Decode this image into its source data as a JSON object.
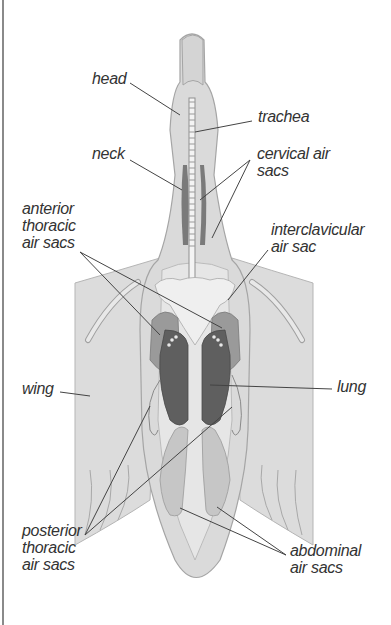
{
  "diagram": {
    "colors": {
      "body": "#d9d9d9",
      "outline": "#9a9a9a",
      "wing": "#dcdcdc",
      "air_sac": "#c8c8c8",
      "lung": "#6e6e6e",
      "lung_dark": "#555555",
      "leader_line": "#444444",
      "text": "#333333"
    },
    "labels": {
      "head": "head",
      "trachea": "trachea",
      "neck": "neck",
      "cervical_air_sacs": "cervical air\nsacs",
      "anterior_thoracic_air_sacs": "anterior\nthoracic\nair sacs",
      "interclavicular_air_sac": "interclavicular\nair sac",
      "wing": "wing",
      "lung": "lung",
      "posterior_thoracic_air_sacs": "posterior\nthoracic\nair sacs",
      "abdominal_air_sacs": "abdominal\nair sacs"
    }
  }
}
